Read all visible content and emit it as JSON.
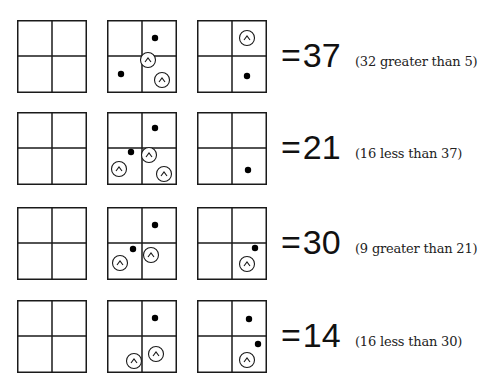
{
  "title": "",
  "rows": [
    {
      "value": "37",
      "equals": "=",
      "note": "(32 greater than 5)",
      "boxes": [
        {
          "dots": [],
          "circles": []
        },
        {
          "dots": [
            [
              48,
              18
            ],
            [
              14,
              54
            ]
          ],
          "circles": [
            [
              41,
              40
            ],
            [
              55,
              60
            ]
          ]
        },
        {
          "dots": [
            [
              50,
              56
            ]
          ],
          "circles": [
            [
              50,
              18
            ]
          ]
        }
      ]
    },
    {
      "value": "21",
      "equals": "=",
      "note": "(16 less than 37)",
      "boxes": [
        {
          "dots": [],
          "circles": []
        },
        {
          "dots": [
            [
              48,
              16
            ],
            [
              24,
              40
            ]
          ],
          "circles": [
            [
              12,
              57
            ],
            [
              42,
              43
            ],
            [
              57,
              62
            ]
          ]
        },
        {
          "dots": [
            [
              51,
              58
            ]
          ],
          "circles": []
        }
      ]
    },
    {
      "value": "30",
      "equals": "=",
      "note": "(9 greater than 21)",
      "boxes": [
        {
          "dots": [],
          "circles": []
        },
        {
          "dots": [
            [
              48,
              18
            ],
            [
              26,
              42
            ]
          ],
          "circles": [
            [
              13,
              56
            ],
            [
              44,
              48
            ]
          ]
        },
        {
          "dots": [
            [
              58,
              41
            ]
          ],
          "circles": [
            [
              50,
              57
            ]
          ]
        }
      ]
    },
    {
      "value": "14",
      "equals": "=",
      "note": "(16 less than 30)",
      "boxes": [
        {
          "dots": [],
          "circles": []
        },
        {
          "dots": [
            [
              48,
              18
            ]
          ],
          "circles": [
            [
              27,
              61
            ],
            [
              49,
              54
            ]
          ]
        },
        {
          "dots": [
            [
              52,
              19
            ],
            [
              61,
              44
            ]
          ],
          "circles": [
            [
              50,
              60
            ]
          ]
        }
      ]
    }
  ],
  "legend": {
    "dot_icon": "filled-dot",
    "circle_icon": "circled-caret"
  },
  "colors": {
    "line": "#1a1a1a",
    "background": "#ffffff"
  }
}
